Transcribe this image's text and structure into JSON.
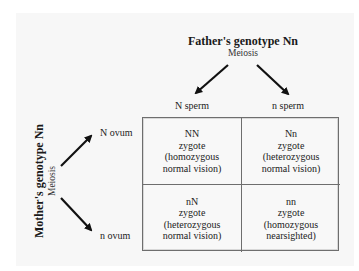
{
  "father": {
    "title": "Father's genotype Nn",
    "process": "Meiosis",
    "gametes": [
      "N sperm",
      "n sperm"
    ]
  },
  "mother": {
    "title": "Mother's genotype Nn",
    "process": "Meiosis",
    "gametes": [
      "N ovum",
      "n ovum"
    ]
  },
  "punnett": {
    "cells": [
      {
        "genotype": "NN",
        "label": "zygote",
        "desc1": "(homozygous",
        "desc2": "normal vision)"
      },
      {
        "genotype": "Nn",
        "label": "zygote",
        "desc1": "(heterozygous",
        "desc2": "normal vision)"
      },
      {
        "genotype": "nN",
        "label": "zygote",
        "desc1": "(heterozygous",
        "desc2": "normal vision)"
      },
      {
        "genotype": "nn",
        "label": "zygote",
        "desc1": "(homozygous",
        "desc2": "nearsighted)"
      }
    ]
  },
  "colors": {
    "panel": "#f7f7f7",
    "border": "#6e6e6e",
    "arrow": "#111111"
  }
}
